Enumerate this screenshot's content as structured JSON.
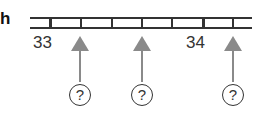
{
  "row_label": "h",
  "number_line": {
    "labels": [
      {
        "text": "33",
        "x": 33
      },
      {
        "text": "34",
        "x": 186
      }
    ],
    "ticks_x": [
      50,
      81,
      112,
      142,
      172,
      203,
      233
    ],
    "major_ticks_x": [
      50,
      203
    ]
  },
  "arrows": [
    {
      "x": 80,
      "question": "?"
    },
    {
      "x": 142,
      "question": "?"
    },
    {
      "x": 233,
      "question": "?"
    }
  ],
  "colors": {
    "line": "#333333",
    "arrow": "#8a8a8a"
  }
}
